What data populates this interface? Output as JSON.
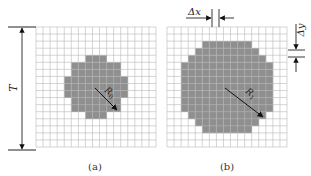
{
  "figure": {
    "panels": [
      {
        "id": "a",
        "caption": "(a)",
        "radius_label": "R",
        "radius_sub": "0",
        "grid_cells": 17,
        "circle_radius_cells": 4.3
      },
      {
        "id": "b",
        "caption": "(b)",
        "radius_label": "R",
        "radius_sub": "1",
        "grid_cells": 17,
        "circle_radius_cells": 6.8
      }
    ],
    "height_label": "T",
    "dx_label": "Δx",
    "dy_label": "Δy"
  },
  "colors": {
    "grid": "#b8b8b8",
    "fill": "#8f8f8f",
    "arrow": "#111111"
  }
}
